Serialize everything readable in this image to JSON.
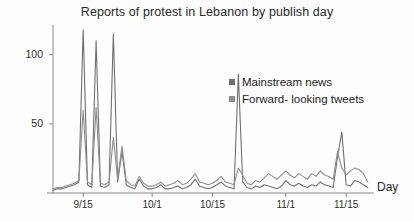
{
  "chart_data": {
    "type": "line",
    "title": "Reports of protest in Lebanon by publish day",
    "xlabel": "Day",
    "ylabel": "",
    "grid": false,
    "legend_position": "center-right",
    "xlim": [
      0,
      74
    ],
    "ylim": [
      0,
      120
    ],
    "yticks": [
      50,
      100
    ],
    "ytick_labels": [
      "50",
      "100"
    ],
    "xticks": [
      7,
      23,
      37,
      54,
      68
    ],
    "xtick_labels": [
      "9/15",
      "10/1",
      "10/15",
      "11/1",
      "11/15"
    ],
    "colors": {
      "mainstream_news": "#6f6f6f",
      "forward_looking_tweets": "#8e8e8e",
      "axis": "#8a8a8a",
      "text": "#2a2a2a"
    },
    "series": [
      {
        "name": "Mainstream news",
        "color": "#6f6f6f",
        "values": [
          2,
          3,
          3,
          4,
          5,
          6,
          8,
          118,
          6,
          4,
          110,
          5,
          4,
          6,
          115,
          8,
          30,
          6,
          4,
          3,
          10,
          5,
          3,
          3,
          4,
          6,
          3,
          3,
          4,
          5,
          3,
          4,
          6,
          10,
          5,
          4,
          3,
          4,
          6,
          8,
          5,
          4,
          3,
          86,
          8,
          4,
          3,
          5,
          4,
          6,
          5,
          4,
          3,
          5,
          9,
          6,
          5,
          7,
          5,
          4,
          6,
          5,
          8,
          6,
          5,
          4,
          26,
          44,
          6,
          5,
          9,
          8,
          6,
          4
        ]
      },
      {
        "name": "Forward- looking tweets",
        "color": "#8e8e8e",
        "values": [
          3,
          4,
          4,
          5,
          6,
          7,
          9,
          60,
          8,
          6,
          62,
          7,
          6,
          8,
          40,
          10,
          34,
          9,
          6,
          5,
          12,
          7,
          5,
          5,
          6,
          8,
          5,
          6,
          7,
          9,
          6,
          7,
          10,
          14,
          8,
          7,
          6,
          7,
          9,
          12,
          8,
          7,
          6,
          18,
          13,
          7,
          6,
          9,
          8,
          11,
          14,
          12,
          10,
          13,
          16,
          13,
          11,
          14,
          12,
          10,
          14,
          12,
          16,
          13,
          12,
          10,
          30,
          18,
          13,
          16,
          18,
          17,
          14,
          8
        ]
      }
    ]
  },
  "legend": {
    "items": [
      {
        "label": "Mainstream news",
        "color": "#6f6f6f"
      },
      {
        "label": "Forward- looking tweets",
        "color": "#8e8e8e"
      }
    ]
  }
}
